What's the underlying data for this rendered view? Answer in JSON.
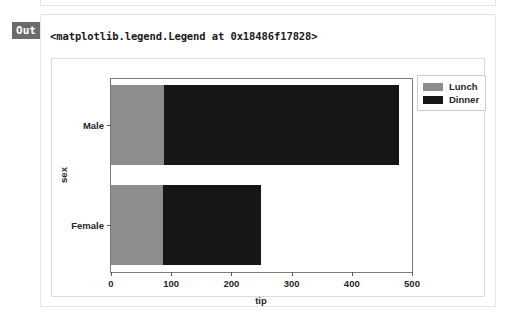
{
  "notebook": {
    "out_label": "Out",
    "repr_text": "<matplotlib.legend.Legend at 0x18486f17828>"
  },
  "chart_data": {
    "type": "bar",
    "orientation": "horizontal",
    "stacked": true,
    "title": "",
    "xlabel": "tip",
    "ylabel": "sex",
    "categories": [
      "Male",
      "Female"
    ],
    "xticks": [
      0,
      100,
      200,
      300,
      400,
      500
    ],
    "xlim": [
      0,
      500
    ],
    "grid": false,
    "legend_position": "upper right",
    "series": [
      {
        "name": "Lunch",
        "color": "#8d8d8d",
        "values": [
          88,
          86
        ]
      },
      {
        "name": "Dinner",
        "color": "#161616",
        "values": [
          390,
          163
        ]
      }
    ],
    "totals": [
      478,
      249
    ],
    "annotations": []
  }
}
